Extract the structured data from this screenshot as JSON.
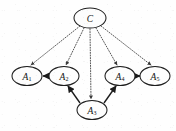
{
  "figure": {
    "background_color": "#fefefe",
    "width": 176,
    "height": 131,
    "node_fill": "#fdfdfd",
    "node_stroke": "#1d1d1d",
    "solid_edge_color": "#1b1b1b",
    "dotted_edge_color": "#3a3a3a"
  },
  "nodes": [
    {
      "id": "C",
      "label": "C",
      "base": "C",
      "sub": "",
      "cx": 90,
      "cy": 18,
      "rx": 16,
      "ry": 10
    },
    {
      "id": "A1",
      "label": "A1",
      "base": "A",
      "sub": "1",
      "cx": 27,
      "cy": 76,
      "rx": 15,
      "ry": 9.5
    },
    {
      "id": "A2",
      "label": "A2",
      "base": "A",
      "sub": "2",
      "cx": 64,
      "cy": 76,
      "rx": 15,
      "ry": 9.5
    },
    {
      "id": "A3",
      "label": "A3",
      "base": "A",
      "sub": "3",
      "cx": 92,
      "cy": 110,
      "rx": 15,
      "ry": 9.5
    },
    {
      "id": "A4",
      "label": "A4",
      "base": "A",
      "sub": "4",
      "cx": 120,
      "cy": 76,
      "rx": 15,
      "ry": 9.5
    },
    {
      "id": "A5",
      "label": "A5",
      "base": "A",
      "sub": "5",
      "cx": 155,
      "cy": 76,
      "rx": 15,
      "ry": 9.5
    }
  ],
  "edges_dotted": [
    {
      "id": "C-A1",
      "from": "C",
      "to": "A1",
      "style": "dotted",
      "arrow": true,
      "x1": 80,
      "y1": 26,
      "x2": 31,
      "y2": 65
    },
    {
      "id": "C-A2",
      "from": "C",
      "to": "A2",
      "style": "dotted",
      "arrow": true,
      "x1": 84,
      "y1": 28,
      "x2": 66,
      "y2": 65
    },
    {
      "id": "C-A3",
      "from": "C",
      "to": "A3",
      "style": "dotted",
      "arrow": true,
      "x1": 90,
      "y1": 29,
      "x2": 91,
      "y2": 99
    },
    {
      "id": "C-A4",
      "from": "C",
      "to": "A4",
      "style": "dotted",
      "arrow": true,
      "x1": 96,
      "y1": 28,
      "x2": 117,
      "y2": 65
    },
    {
      "id": "C-A5",
      "from": "C",
      "to": "A5",
      "style": "dotted",
      "arrow": true,
      "x1": 101,
      "y1": 26,
      "x2": 151,
      "y2": 65
    }
  ],
  "edges_solid": [
    {
      "id": "A2-A1",
      "from": "A2",
      "to": "A1",
      "style": "solid",
      "arrow": true,
      "x1": 49,
      "y1": 76,
      "x2": 43,
      "y2": 76
    },
    {
      "id": "A3-A2",
      "from": "A3",
      "to": "A2",
      "style": "solid",
      "arrow": true,
      "x1": 80,
      "y1": 103,
      "x2": 68,
      "y2": 86
    },
    {
      "id": "A3-A4",
      "from": "A3",
      "to": "A4",
      "style": "solid",
      "arrow": true,
      "x1": 104,
      "y1": 103,
      "x2": 116,
      "y2": 86
    },
    {
      "id": "A4-A5",
      "from": "A4",
      "to": "A5",
      "style": "solid",
      "arrow": true,
      "x1": 135,
      "y1": 76,
      "x2": 140,
      "y2": 76
    }
  ]
}
